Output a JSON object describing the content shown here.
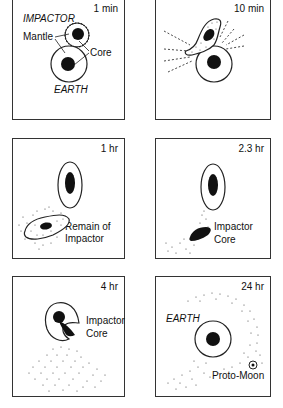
{
  "figure": {
    "panels": [
      {
        "id": "p1",
        "time": "1 min",
        "labels": {
          "impactor": "IMPACTOR",
          "mantle": "Mantle",
          "core": "Core",
          "earth": "EARTH"
        }
      },
      {
        "id": "p2",
        "time": "10 min",
        "labels": {}
      },
      {
        "id": "p3",
        "time": "1 hr",
        "labels": {
          "remain_line1": "Remain of",
          "remain_line2": "Impactor"
        }
      },
      {
        "id": "p4",
        "time": "2.3 hr",
        "labels": {
          "core_line1": "Impactor",
          "core_line2": "Core"
        }
      },
      {
        "id": "p5",
        "time": "4 hr",
        "labels": {
          "core_line1": "Impactor",
          "core_line2": "Core"
        }
      },
      {
        "id": "p6",
        "time": "24 hr",
        "labels": {
          "earth": "EARTH",
          "moon": "Proto-Moon"
        }
      }
    ]
  },
  "colors": {
    "line": "#222222",
    "fill": "#111111",
    "background": "#ffffff"
  }
}
